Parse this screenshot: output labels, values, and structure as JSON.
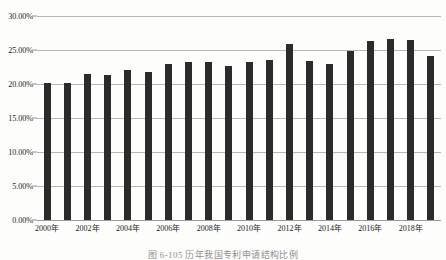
{
  "chart_data": {
    "type": "bar",
    "title": "",
    "xlabel": "",
    "ylabel": "",
    "ylim": [
      0,
      0.3
    ],
    "grid": true,
    "legend": "none",
    "y_tick_labels": [
      "30.00%",
      "25.00%",
      "20.00%",
      "15.00%",
      "10.00%",
      "5.00%",
      "0.00%"
    ],
    "y_tick_values": [
      30.0,
      25.0,
      20.0,
      15.0,
      10.0,
      5.0,
      0.0
    ],
    "x_tick_labels": [
      "2000年",
      "2002年",
      "2004年",
      "2006年",
      "2008年",
      "2010年",
      "2012年",
      "2014年",
      "2016年",
      "2018年"
    ],
    "categories": [
      "2000年",
      "2001年",
      "2002年",
      "2003年",
      "2004年",
      "2005年",
      "2006年",
      "2007年",
      "2008年",
      "2009年",
      "2010年",
      "2011年",
      "2012年",
      "2013年",
      "2014年",
      "2015年",
      "2016年",
      "2017年",
      "2018年",
      "2019年"
    ],
    "values": [
      20.2,
      20.2,
      21.5,
      21.3,
      22.1,
      21.7,
      22.9,
      23.2,
      23.2,
      22.6,
      23.2,
      23.5,
      25.9,
      23.4,
      22.9,
      24.8,
      26.3,
      26.6,
      26.5,
      24.1
    ],
    "series": [
      {
        "name": "占比",
        "color": "#2b2b2b",
        "values": [
          20.2,
          20.2,
          21.5,
          21.3,
          22.1,
          21.7,
          22.9,
          23.2,
          23.2,
          22.6,
          23.2,
          23.5,
          25.9,
          23.4,
          22.9,
          24.8,
          26.3,
          26.6,
          26.5,
          24.1
        ]
      }
    ]
  },
  "caption": {
    "text": "图 6-105  历年我国专利申请结构比例"
  },
  "style": {
    "bar_color": "#2b2b2b",
    "gridline_color": "#9a9a9a",
    "background": "#fdfdfc",
    "text_color": "#1a1a1a"
  }
}
